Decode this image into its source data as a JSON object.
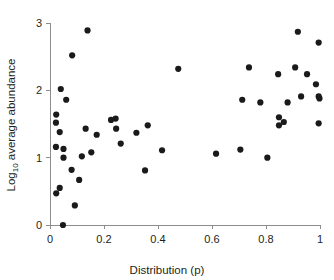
{
  "chart_data": {
    "type": "scatter",
    "title": "",
    "xlabel": "Distribution (p)",
    "ylabel": "Log10 average abundance",
    "ylabel_base": "Log",
    "ylabel_subscript": "10",
    "ylabel_rest": " average abundance",
    "xlim": [
      0,
      1
    ],
    "ylim": [
      0,
      3
    ],
    "xticks": [
      0,
      0.2,
      0.4,
      0.6,
      0.8,
      1
    ],
    "xtick_labels": [
      "0",
      "0.2",
      "0.4",
      "0.6",
      "0.8",
      "1"
    ],
    "yticks": [
      0,
      1,
      2,
      3
    ],
    "ytick_labels": [
      "0",
      "1",
      "2",
      "3"
    ],
    "grid": false,
    "legend": false,
    "marker": "filled-circle",
    "marker_color": "#1a1a1a",
    "marker_size": 3.1,
    "axis_color": "#8d8d8d",
    "n_points": 56,
    "points": [
      [
        0.048,
        0.0
      ],
      [
        0.023,
        0.47
      ],
      [
        0.036,
        0.55
      ],
      [
        0.092,
        0.29
      ],
      [
        0.08,
        0.82
      ],
      [
        0.108,
        0.67
      ],
      [
        0.022,
        1.16
      ],
      [
        0.05,
        1.13
      ],
      [
        0.05,
        1.0
      ],
      [
        0.118,
        1.02
      ],
      [
        0.023,
        1.64
      ],
      [
        0.022,
        1.52
      ],
      [
        0.036,
        1.38
      ],
      [
        0.04,
        2.02
      ],
      [
        0.06,
        1.86
      ],
      [
        0.082,
        2.52
      ],
      [
        0.139,
        2.89
      ],
      [
        0.132,
        1.43
      ],
      [
        0.153,
        1.08
      ],
      [
        0.173,
        1.34
      ],
      [
        0.226,
        1.56
      ],
      [
        0.243,
        1.58
      ],
      [
        0.245,
        1.43
      ],
      [
        0.262,
        1.21
      ],
      [
        0.32,
        1.37
      ],
      [
        0.362,
        1.48
      ],
      [
        0.352,
        0.81
      ],
      [
        0.415,
        1.11
      ],
      [
        0.475,
        2.32
      ],
      [
        0.615,
        1.06
      ],
      [
        0.705,
        1.12
      ],
      [
        0.712,
        1.86
      ],
      [
        0.737,
        2.34
      ],
      [
        0.779,
        1.82
      ],
      [
        0.805,
        1.0
      ],
      [
        0.845,
        2.24
      ],
      [
        0.848,
        1.6
      ],
      [
        0.848,
        1.48
      ],
      [
        0.866,
        1.53
      ],
      [
        0.88,
        1.82
      ],
      [
        0.908,
        2.34
      ],
      [
        0.918,
        2.87
      ],
      [
        0.93,
        1.91
      ],
      [
        0.952,
        2.24
      ],
      [
        0.985,
        2.09
      ],
      [
        0.995,
        2.71
      ],
      [
        0.995,
        1.91
      ],
      [
        0.998,
        1.88
      ],
      [
        0.995,
        1.51
      ]
    ]
  }
}
